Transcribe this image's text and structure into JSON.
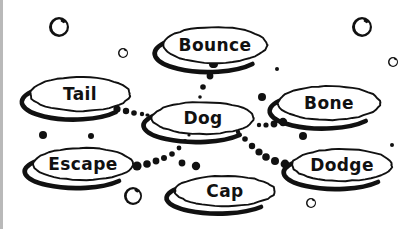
{
  "diagram": {
    "style": "hand-drawn sketch",
    "background_color": "#ffffff",
    "ink_color": "#111111",
    "edge_bar_color": "#b9b9b9",
    "width": 420,
    "height": 229,
    "nodes": [
      {
        "id": "bounce",
        "label": "Bounce",
        "cx": 215,
        "cy": 45,
        "rx": 52,
        "ry": 18,
        "font_size": 17
      },
      {
        "id": "tail",
        "label": "Tail",
        "cx": 80,
        "cy": 94,
        "rx": 50,
        "ry": 17,
        "font_size": 17
      },
      {
        "id": "dog",
        "label": "Dog",
        "cx": 203,
        "cy": 118,
        "rx": 51,
        "ry": 16,
        "font_size": 17
      },
      {
        "id": "bone",
        "label": "Bone",
        "cx": 329,
        "cy": 103,
        "rx": 51,
        "ry": 17,
        "font_size": 17
      },
      {
        "id": "escape",
        "label": "Escape",
        "cx": 83,
        "cy": 164,
        "rx": 50,
        "ry": 16,
        "font_size": 17
      },
      {
        "id": "dodge",
        "label": "Dodge",
        "cx": 342,
        "cy": 165,
        "rx": 50,
        "ry": 16,
        "font_size": 17
      },
      {
        "id": "cap",
        "label": "Cap",
        "cx": 225,
        "cy": 191,
        "rx": 50,
        "ry": 15,
        "font_size": 17
      }
    ],
    "links": [
      {
        "id": "bounce-dog",
        "from": "bounce",
        "to": "dog",
        "dots": [
          {
            "x": 213,
            "y": 64,
            "r": 4.0
          },
          {
            "x": 210,
            "y": 76,
            "r": 3.4
          },
          {
            "x": 203,
            "y": 87,
            "r": 2.8
          },
          {
            "x": 200,
            "y": 97,
            "r": 1.8
          }
        ]
      },
      {
        "id": "tail-dog",
        "from": "tail",
        "to": "dog",
        "dots": [
          {
            "x": 117,
            "y": 109,
            "r": 3.6
          },
          {
            "x": 126,
            "y": 111,
            "r": 3.2
          },
          {
            "x": 134,
            "y": 113,
            "r": 2.8
          },
          {
            "x": 142,
            "y": 114,
            "r": 2.2
          },
          {
            "x": 148,
            "y": 115,
            "r": 1.6
          }
        ]
      },
      {
        "id": "dog-bone",
        "from": "dog",
        "to": "bone",
        "dots": [
          {
            "x": 259,
            "y": 125,
            "r": 2.2
          },
          {
            "x": 266,
            "y": 125,
            "r": 2.6
          },
          {
            "x": 274,
            "y": 124,
            "r": 3.4
          },
          {
            "x": 283,
            "y": 122,
            "r": 4.2
          }
        ]
      },
      {
        "id": "dog-dodge",
        "from": "dog",
        "to": "dodge",
        "dots": [
          {
            "x": 238,
            "y": 132,
            "r": 2.2
          },
          {
            "x": 245,
            "y": 139,
            "r": 2.8
          },
          {
            "x": 252,
            "y": 146,
            "r": 3.2
          },
          {
            "x": 259,
            "y": 152,
            "r": 3.6
          },
          {
            "x": 266,
            "y": 157,
            "r": 3.8
          },
          {
            "x": 275,
            "y": 161,
            "r": 4.0
          },
          {
            "x": 285,
            "y": 164,
            "r": 4.4
          }
        ]
      },
      {
        "id": "escape-dog",
        "from": "escape",
        "to": "dog",
        "dots": [
          {
            "x": 137,
            "y": 166,
            "r": 4.6
          },
          {
            "x": 147,
            "y": 164,
            "r": 3.8
          },
          {
            "x": 156,
            "y": 161,
            "r": 3.4
          },
          {
            "x": 164,
            "y": 158,
            "r": 3.0
          },
          {
            "x": 172,
            "y": 154,
            "r": 2.8
          },
          {
            "x": 179,
            "y": 148,
            "r": 2.4
          },
          {
            "x": 185,
            "y": 141,
            "r": 2.0
          },
          {
            "x": 189,
            "y": 135,
            "r": 1.6
          }
        ]
      },
      {
        "id": "escape-cap",
        "from": "escape",
        "to": "cap",
        "dots": [
          {
            "x": 182,
            "y": 163,
            "r": 3.4
          },
          {
            "x": 196,
            "y": 166,
            "r": 4.2
          }
        ]
      }
    ],
    "decorations": [
      {
        "id": "deco-sphere-top-left",
        "x": 59,
        "y": 27,
        "r": 10,
        "highlight": true
      },
      {
        "id": "deco-sphere-top-right",
        "x": 362,
        "y": 27,
        "r": 10,
        "highlight": true
      },
      {
        "id": "deco-sphere-bottom-left",
        "x": 133,
        "y": 196,
        "r": 9,
        "highlight": true
      },
      {
        "id": "deco-dot-upper-left",
        "x": 123,
        "y": 53,
        "r": 5,
        "highlight": true
      },
      {
        "id": "deco-dot-upper-right",
        "x": 393,
        "y": 62,
        "r": 5,
        "highlight": true
      },
      {
        "id": "deco-dot-bottom-right",
        "x": 311,
        "y": 203,
        "r": 5,
        "highlight": true
      },
      {
        "id": "deco-dot-mid-left-a",
        "x": 43,
        "y": 135,
        "r": 4,
        "highlight": false
      },
      {
        "id": "deco-dot-mid-left-b",
        "x": 91,
        "y": 136,
        "r": 3,
        "highlight": false
      },
      {
        "id": "deco-dot-above-dog",
        "x": 214,
        "y": 64,
        "r": 4,
        "highlight": false
      },
      {
        "id": "deco-dot-right-of-bounce",
        "x": 277,
        "y": 69,
        "r": 2,
        "highlight": false
      },
      {
        "id": "deco-dot-left-of-bone",
        "x": 262,
        "y": 97,
        "r": 4,
        "highlight": false
      },
      {
        "id": "deco-dot-near-dodge-top",
        "x": 303,
        "y": 136,
        "r": 4,
        "highlight": false
      },
      {
        "id": "deco-dot-far-right",
        "x": 392,
        "y": 145,
        "r": 2,
        "highlight": false
      },
      {
        "id": "deco-dot-left-of-dog",
        "x": 147,
        "y": 115,
        "r": 1.6,
        "highlight": false
      }
    ]
  }
}
